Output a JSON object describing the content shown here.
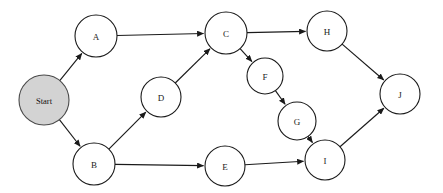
{
  "diagram": {
    "type": "directed-graph",
    "background_color": "#ffffff",
    "edge_color": "#1a1a1a",
    "node_fill": "#ffffff",
    "node_stroke": "#1a1a1a",
    "start_node_fill": "#d3d3d3",
    "nodes": [
      {
        "id": "start",
        "label": "Start",
        "cx": 44,
        "cy": 100,
        "r": 25,
        "highlight": true
      },
      {
        "id": "A",
        "label": "A",
        "cx": 96,
        "cy": 36,
        "r": 21,
        "highlight": false
      },
      {
        "id": "B",
        "label": "B",
        "cx": 94,
        "cy": 164,
        "r": 21,
        "highlight": false
      },
      {
        "id": "C",
        "label": "C",
        "cx": 226,
        "cy": 33,
        "r": 21,
        "highlight": false
      },
      {
        "id": "D",
        "label": "D",
        "cx": 161,
        "cy": 97,
        "r": 20,
        "highlight": false
      },
      {
        "id": "E",
        "label": "E",
        "cx": 225,
        "cy": 166,
        "r": 20,
        "highlight": false
      },
      {
        "id": "F",
        "label": "F",
        "cx": 265,
        "cy": 76,
        "r": 18,
        "highlight": false
      },
      {
        "id": "G",
        "label": "G",
        "cx": 297,
        "cy": 121,
        "r": 19,
        "highlight": false
      },
      {
        "id": "H",
        "label": "H",
        "cx": 327,
        "cy": 31,
        "r": 20,
        "highlight": false
      },
      {
        "id": "I",
        "label": "I",
        "cx": 325,
        "cy": 160,
        "r": 20,
        "highlight": false
      },
      {
        "id": "J",
        "label": "J",
        "cx": 400,
        "cy": 94,
        "r": 20,
        "highlight": false
      }
    ],
    "edges": [
      {
        "from": "start",
        "to": "A",
        "directed": true
      },
      {
        "from": "start",
        "to": "B",
        "directed": true
      },
      {
        "from": "A",
        "to": "C",
        "directed": true
      },
      {
        "from": "B",
        "to": "D",
        "directed": true
      },
      {
        "from": "B",
        "to": "E",
        "directed": true
      },
      {
        "from": "D",
        "to": "C",
        "directed": true
      },
      {
        "from": "C",
        "to": "H",
        "directed": true
      },
      {
        "from": "C",
        "to": "F",
        "directed": true
      },
      {
        "from": "F",
        "to": "G",
        "directed": true
      },
      {
        "from": "G",
        "to": "I",
        "directed": true
      },
      {
        "from": "E",
        "to": "I",
        "directed": true
      },
      {
        "from": "H",
        "to": "J",
        "directed": true
      },
      {
        "from": "I",
        "to": "J",
        "directed": true
      }
    ]
  }
}
